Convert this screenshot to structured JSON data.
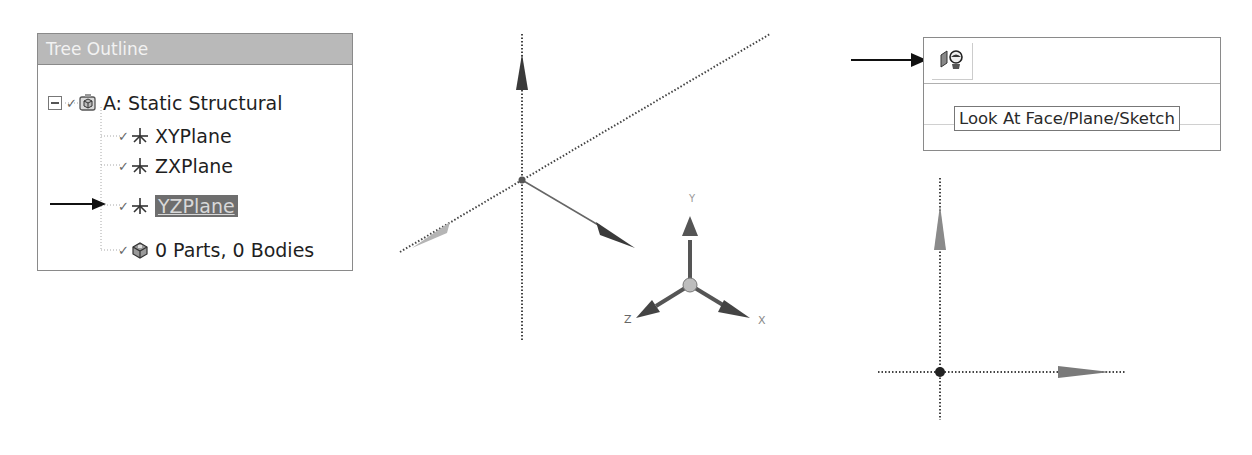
{
  "tree_outline": {
    "title": "Tree Outline",
    "root": {
      "label": "A: Static Structural",
      "icon": "model-icon",
      "expanded": true
    },
    "children": [
      {
        "label": "XYPlane",
        "icon": "plane-icon",
        "selected": false
      },
      {
        "label": "ZXPlane",
        "icon": "plane-icon",
        "selected": false
      },
      {
        "label": "YZPlane",
        "icon": "plane-icon",
        "selected": true
      },
      {
        "label": "0 Parts, 0 Bodies",
        "icon": "parts-icon",
        "selected": false
      }
    ]
  },
  "toolbar": {
    "look_at_button": {
      "icon": "look-at-icon"
    },
    "tooltip": "Look At Face/Plane/Sketch"
  },
  "viewport_3d": {
    "triad_labels": {
      "x": "X",
      "y": "Y",
      "z": "Z"
    }
  },
  "colors": {
    "header_bg": "#b9b9b9",
    "selection_bg": "#6e6e6e",
    "axis_dark": "#3a3a3a"
  }
}
